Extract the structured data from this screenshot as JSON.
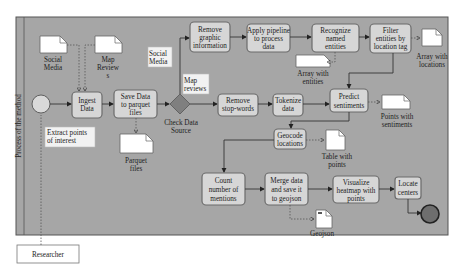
{
  "pool": {
    "lane_label": "Process of the method"
  },
  "participant": {
    "label": "Researcher"
  },
  "annotations": {
    "extract": [
      "Extract points",
      "of interest"
    ],
    "social_media_branch": [
      "Social",
      "Media"
    ],
    "map_reviews_branch": [
      "Map",
      "reviews"
    ]
  },
  "gateway": {
    "label": [
      "Check Data",
      "Source"
    ]
  },
  "tasks": {
    "ingest": [
      "Ingest",
      "Data"
    ],
    "save": [
      "Save Data",
      "to parquet",
      "files"
    ],
    "remove_graphic": [
      "Remove",
      "graphic",
      "information"
    ],
    "apply_pipeline": [
      "Apply pipeline",
      "to process",
      "data"
    ],
    "recognize": [
      "Recognize",
      "named",
      "entities"
    ],
    "filter": [
      "Filter",
      "entities by",
      "location tag"
    ],
    "remove_stop": [
      "Remove",
      "stop-words"
    ],
    "tokenize": [
      "Tokenize",
      "data"
    ],
    "predict": [
      "Predict",
      "sentiments"
    ],
    "geocode": [
      "Geocode",
      "locations"
    ],
    "count": [
      "Count",
      "number of",
      "mentions"
    ],
    "merge": [
      "Merge data",
      "and save it",
      "to geojson"
    ],
    "visualize": [
      "Visualize",
      "heatmap with",
      "points"
    ],
    "locate": [
      "Locate",
      "centers"
    ]
  },
  "data_objects": {
    "social_media_in": [
      "Social",
      "Media"
    ],
    "map_reviews_in": [
      "Map",
      "Review",
      "s"
    ],
    "parquet": [
      "Parquet",
      "files"
    ],
    "array_entities": [
      "Array with",
      "entities"
    ],
    "array_locations": [
      "Array with",
      "locations"
    ],
    "points_sentiments": [
      "Points with",
      "sentiments"
    ],
    "table_points": [
      "Table with",
      "points"
    ],
    "geojson": [
      "Geojson"
    ]
  },
  "colors": {
    "pool_fill": "#a6a6a6",
    "task_fill": "#d6d6d6",
    "gateway_fill": "#7f7f7f",
    "start_fill": "#d9d9d9",
    "end_fill": "#6e6e6e"
  }
}
